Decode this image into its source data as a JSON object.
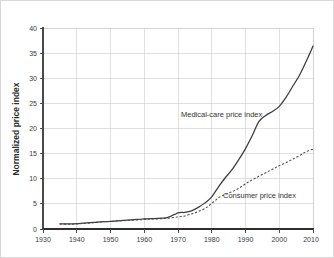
{
  "chart_data": {
    "type": "line",
    "title": "",
    "xlabel": "",
    "ylabel": "Normalized price index",
    "xlim": [
      1930,
      2010
    ],
    "ylim": [
      0,
      40
    ],
    "grid": true,
    "legend_position": "inline-annotations",
    "x_ticks": [
      "1930",
      "1940",
      "1950",
      "1960",
      "1970",
      "1980",
      "1990",
      "2000",
      "2010"
    ],
    "y_ticks": [
      "0",
      "5",
      "10",
      "15",
      "20",
      "25",
      "30",
      "35",
      "40"
    ],
    "series": [
      {
        "name": "Medical-care price index",
        "style": "solid",
        "color": "#3c3c3c",
        "annotation": "Medical-care price index",
        "x": [
          1935,
          1938,
          1940,
          1942,
          1945,
          1948,
          1950,
          1952,
          1955,
          1958,
          1960,
          1962,
          1965,
          1967,
          1969,
          1970,
          1971,
          1972,
          1974,
          1976,
          1978,
          1980,
          1982,
          1984,
          1986,
          1988,
          1990,
          1992,
          1994,
          1996,
          1998,
          2000,
          2002,
          2004,
          2006,
          2008,
          2010
        ],
        "values": [
          1.0,
          1.0,
          1.05,
          1.15,
          1.3,
          1.45,
          1.5,
          1.6,
          1.75,
          1.9,
          2.0,
          2.05,
          2.15,
          2.3,
          2.9,
          3.2,
          3.3,
          3.3,
          3.6,
          4.3,
          5.2,
          6.4,
          8.4,
          10.2,
          11.8,
          13.8,
          16.0,
          18.6,
          21.4,
          22.6,
          23.4,
          24.4,
          26.2,
          28.4,
          30.6,
          33.4,
          36.4
        ]
      },
      {
        "name": "Consumer price index",
        "style": "dashed",
        "color": "#4a4a4a",
        "annotation": "Consumer price index",
        "x": [
          1935,
          1938,
          1940,
          1942,
          1945,
          1948,
          1950,
          1952,
          1955,
          1958,
          1960,
          1962,
          1965,
          1967,
          1969,
          1970,
          1971,
          1972,
          1974,
          1976,
          1978,
          1980,
          1982,
          1984,
          1986,
          1988,
          1990,
          1992,
          1994,
          1996,
          1998,
          2000,
          2002,
          2004,
          2006,
          2008,
          2010
        ],
        "values": [
          1.0,
          0.95,
          1.0,
          1.1,
          1.25,
          1.45,
          1.5,
          1.6,
          1.7,
          1.8,
          1.9,
          1.95,
          2.05,
          2.15,
          2.3,
          2.4,
          2.5,
          2.6,
          3.0,
          3.5,
          4.1,
          5.1,
          6.2,
          6.9,
          7.4,
          8.1,
          9.0,
          9.8,
          10.5,
          11.2,
          11.9,
          12.6,
          13.2,
          13.9,
          14.6,
          15.4,
          15.9
        ]
      }
    ]
  },
  "axes": {
    "y_axis_title": "Normalized price index"
  }
}
